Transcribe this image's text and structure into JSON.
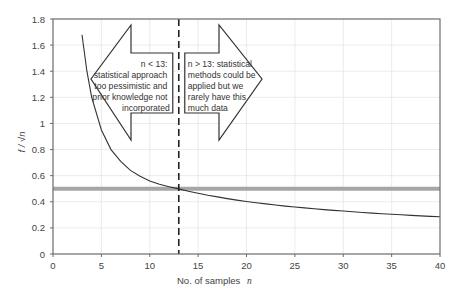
{
  "chart_data": {
    "type": "line",
    "title": "",
    "xlabel": "No. of samples",
    "xlabel_var": "n",
    "ylabel": "f / √n",
    "xlim": [
      0,
      40
    ],
    "ylim": [
      0,
      1.8
    ],
    "xticks": [
      0,
      5,
      10,
      15,
      20,
      25,
      30,
      35,
      40
    ],
    "yticks": [
      0,
      0.2,
      0.4,
      0.6,
      0.8,
      1,
      1.2,
      1.4,
      1.6,
      1.8
    ],
    "ytick_labels": [
      "0",
      "0.2",
      "0.4",
      "0.6",
      "0.8",
      "1",
      "1.2",
      "1.4",
      "1.6",
      "1.8"
    ],
    "grid": true,
    "legend": "none",
    "series": [
      {
        "name": "f/sqrt(n)",
        "formula": "1.8 / sqrt(n)",
        "color": "#333333",
        "x": [
          3,
          4,
          5,
          6,
          7,
          8,
          9,
          10,
          11,
          12,
          13,
          14,
          15,
          16,
          17,
          18,
          19,
          20,
          21,
          22,
          23,
          24,
          25,
          26,
          27,
          28,
          29,
          30,
          31,
          32,
          33,
          34,
          35,
          36,
          37,
          38,
          39,
          40
        ],
        "values": [
          1.039,
          0.9,
          0.805,
          0.735,
          0.68,
          0.636,
          0.6,
          0.569,
          0.543,
          0.52,
          0.499,
          0.481,
          0.465,
          0.45,
          0.437,
          0.424,
          0.413,
          0.402,
          0.393,
          0.384,
          0.375,
          0.367,
          0.36,
          0.353,
          0.346,
          0.34,
          0.334,
          0.329,
          0.323,
          0.318,
          0.313,
          0.309,
          0.304,
          0.3,
          0.296,
          0.292,
          0.288,
          0.285
        ]
      }
    ],
    "reference_lines": [
      {
        "name": "threshold",
        "orientation": "horizontal",
        "value": 0.5,
        "color": "#a6a6a6",
        "style": "solid-thick"
      },
      {
        "name": "n-13",
        "orientation": "vertical",
        "value": 13,
        "color": "#222222",
        "style": "dashed"
      }
    ],
    "annotations": [
      {
        "name": "left-arrow",
        "direction": "left",
        "lines": [
          "n < 13:",
          "statistical approach",
          "too pessimistic and",
          "prior knowledge not",
          "incorporated"
        ]
      },
      {
        "name": "right-arrow",
        "direction": "right",
        "lines": [
          "n > 13: statistical",
          "methods could be",
          "applied but we",
          "rarely have this",
          "much data"
        ]
      }
    ]
  }
}
